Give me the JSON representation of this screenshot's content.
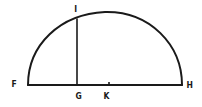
{
  "diagram": {
    "type": "geometry-semicircle",
    "stroke_color": "#1a1a1a",
    "background": "#ffffff",
    "points": {
      "F": {
        "label": "F",
        "x": 28,
        "y": 85
      },
      "G": {
        "label": "G",
        "x": 77,
        "y": 85
      },
      "K": {
        "label": "K",
        "x": 109,
        "y": 85
      },
      "H": {
        "label": "H",
        "x": 182,
        "y": 85
      },
      "I": {
        "label": "I",
        "x": 77,
        "y": 19
      }
    },
    "segments": [
      {
        "name": "diameter-FH",
        "from": "F",
        "to": "H"
      },
      {
        "name": "perpendicular-GI",
        "from": "G",
        "to": "I"
      }
    ],
    "arcs": [
      {
        "name": "semicircle-arc",
        "from": "F",
        "to": "H",
        "through_top_y": 12
      }
    ],
    "tick_marks": [
      {
        "name": "center-tick-K",
        "at": "K"
      }
    ]
  }
}
